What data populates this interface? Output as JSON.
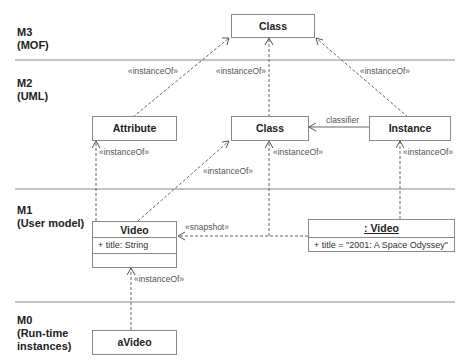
{
  "layers": [
    {
      "id": "M3",
      "label": "M3\n(MOF)"
    },
    {
      "id": "M2",
      "label": "M2\n(UML)"
    },
    {
      "id": "M1",
      "label": "M1\n(User model)"
    },
    {
      "id": "M0",
      "label": "M0\n(Run-time\ninstances)"
    }
  ],
  "boxes": {
    "mof_class": {
      "title": "Class"
    },
    "uml_attribute": {
      "title": "Attribute"
    },
    "uml_class": {
      "title": "Class"
    },
    "uml_instance": {
      "title": "Instance"
    },
    "video_class": {
      "title": "Video",
      "attribute": "+ title: String"
    },
    "video_instance": {
      "title": ": Video",
      "attribute": "+ title = \"2001: A Space Odyssey\""
    },
    "avideo": {
      "title": "aVideo"
    }
  },
  "edges": {
    "attr_to_mof": "«instanceOf»",
    "class_to_mof": "«instanceOf»",
    "instance_to_mof": "«instanceOf»",
    "classifier": "classifier",
    "video_to_attribute": "«instanceOf»",
    "video_to_class": "«instanceOf»",
    "snapshot_to_class": "«instanceOf»",
    "videoinst_to_instance": "«instanceOf»",
    "snapshot": "«snapshot»",
    "avideo_to_video": "«instanceOf»"
  }
}
